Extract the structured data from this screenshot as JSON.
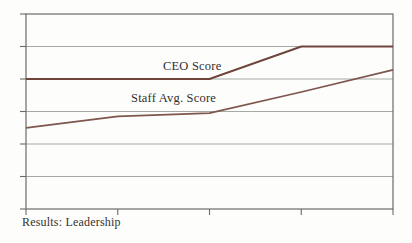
{
  "figure": {
    "caption": "Results: Leadership"
  },
  "chart_data": {
    "type": "line",
    "title": "",
    "xlabel": "",
    "ylabel": "",
    "x": [
      0,
      1,
      2,
      3,
      4
    ],
    "xlim": [
      0,
      4
    ],
    "ylim": [
      0,
      6
    ],
    "y_gridline_step": 1,
    "grid": "horizontal",
    "tick_labels_visible": false,
    "legend_position": "inline-labels",
    "series": [
      {
        "name": "CEO Score",
        "values": [
          4,
          4,
          4,
          5,
          5
        ],
        "color": "#6e443b"
      },
      {
        "name": "Staff Avg. Score",
        "values": [
          2.5,
          2.85,
          2.95,
          3.6,
          4.28
        ],
        "color": "#7e564e"
      }
    ],
    "colors": {
      "frame": "#6b6b69",
      "gridline": "#a4aba6",
      "text": "#32302d",
      "background": "#fdfdfc"
    }
  }
}
